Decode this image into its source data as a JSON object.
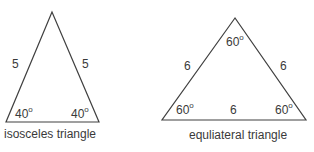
{
  "colors": {
    "stroke": "#404040",
    "text": "#3a3a3a",
    "background": "#ffffff"
  },
  "isosceles": {
    "caption": "isosceles triangle",
    "side_left": "5",
    "side_right": "5",
    "angle_left": "40",
    "angle_right": "40",
    "degree_symbol": "o"
  },
  "equilateral": {
    "caption": "equliateral triangle",
    "side_left": "6",
    "side_right": "6",
    "side_bottom": "6",
    "angle_top": "60",
    "angle_left": "60",
    "angle_right": "60",
    "degree_symbol": "o"
  }
}
